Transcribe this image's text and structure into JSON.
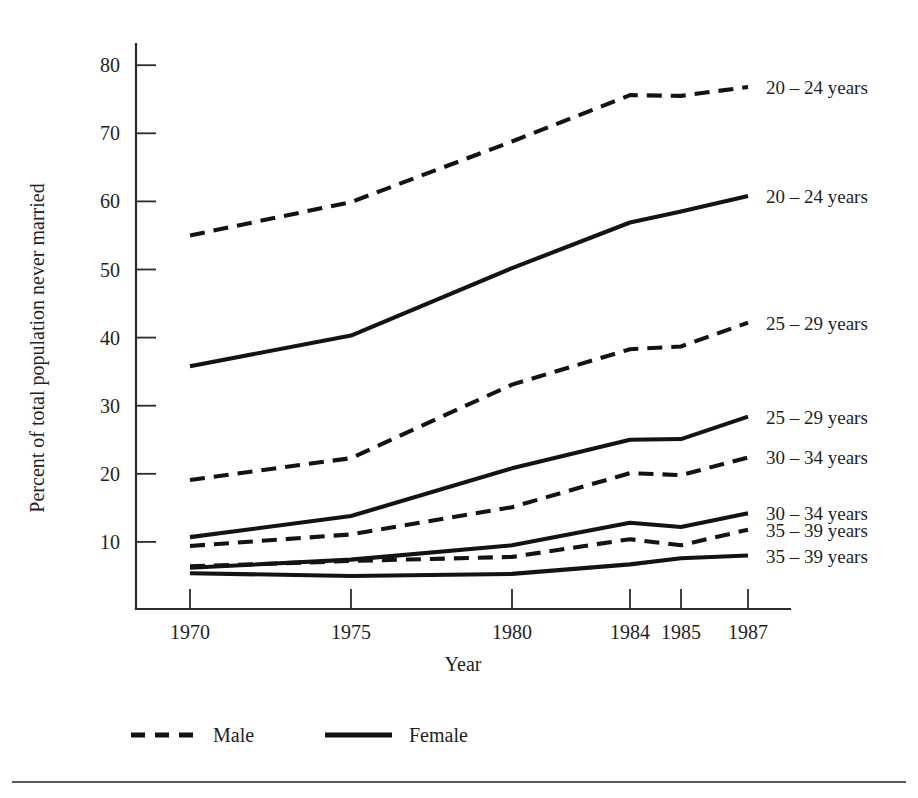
{
  "chart_data": {
    "type": "line",
    "title": "",
    "xlabel": "Year",
    "ylabel": "Percent of total population never married",
    "x": [
      1970,
      1975,
      1980,
      1984,
      1985,
      1987
    ],
    "xtick_labels": [
      "1970",
      "1975",
      "1980",
      "1984",
      "1985",
      "1987"
    ],
    "ytick_labels": [
      "10",
      "20",
      "30",
      "40",
      "50",
      "60",
      "70",
      "80"
    ],
    "yticks": [
      10,
      20,
      30,
      40,
      50,
      60,
      70,
      80
    ],
    "ylim": [
      0,
      84
    ],
    "xlim_positions": [
      190,
      351,
      512,
      630,
      681,
      748
    ],
    "grid": false,
    "legend_position": "below-axes-left",
    "series": [
      {
        "name": "Male 20 - 24 years",
        "sex": "Male",
        "age_group": "20 – 24 years",
        "style": "dashed",
        "end_label": "20 – 24 years",
        "values": [
          55.0,
          59.9,
          68.8,
          75.6,
          75.5,
          76.8
        ]
      },
      {
        "name": "Female 20 - 24 years",
        "sex": "Female",
        "age_group": "20 – 24 years",
        "style": "solid",
        "end_label": "20 – 24 years",
        "values": [
          35.8,
          40.3,
          50.2,
          56.9,
          58.5,
          60.8
        ]
      },
      {
        "name": "Male 25 - 29 years",
        "sex": "Male",
        "age_group": "25 – 29 years",
        "style": "dashed",
        "end_label": "25 – 29 years",
        "values": [
          19.1,
          22.3,
          33.1,
          38.3,
          38.7,
          42.2
        ]
      },
      {
        "name": "Female 25 - 29 years",
        "sex": "Female",
        "age_group": "25 – 29 years",
        "style": "solid",
        "end_label": "25 – 29 years",
        "values": [
          10.7,
          13.8,
          20.8,
          25.0,
          25.1,
          28.4
        ]
      },
      {
        "name": "Male 30 - 34 years",
        "sex": "Male",
        "age_group": "30 – 34 years",
        "style": "dashed",
        "end_label": "30 – 34 years",
        "values": [
          9.4,
          11.1,
          15.1,
          20.1,
          19.8,
          22.4
        ]
      },
      {
        "name": "Female 30 - 34 years",
        "sex": "Female",
        "age_group": "30 – 34 years",
        "style": "solid",
        "end_label": "30 – 34 years",
        "values": [
          6.2,
          7.4,
          9.5,
          12.8,
          12.2,
          14.2
        ]
      },
      {
        "name": "Male 35 - 39 years",
        "sex": "Male",
        "age_group": "35 – 39 years",
        "style": "dashed",
        "end_label": "35 – 39 years",
        "values": [
          6.4,
          7.2,
          7.8,
          10.4,
          9.5,
          11.8
        ]
      },
      {
        "name": "Female 35 - 39 years",
        "sex": "Female",
        "age_group": "35 – 39 years",
        "style": "solid",
        "end_label": "35 – 39 years",
        "values": [
          5.4,
          5.0,
          5.3,
          6.7,
          7.6,
          8.0
        ]
      }
    ],
    "end_labels": [
      {
        "text": "20 – 24 years",
        "y_value": 76.8,
        "style": "dashed"
      },
      {
        "text": "20 – 24 years",
        "y_value": 60.8,
        "style": "solid"
      },
      {
        "text": "25 – 29 years",
        "y_value": 42.2,
        "style": "dashed"
      },
      {
        "text": "25 – 29 years",
        "y_value": 28.4,
        "style": "solid"
      },
      {
        "text": "30 – 34 years",
        "y_value": 22.4,
        "style": "dashed"
      },
      {
        "text": "30 – 34 years",
        "y_value": 14.2,
        "style": "solid"
      },
      {
        "text": "35 – 39 years",
        "y_value": 11.8,
        "style": "dashed"
      },
      {
        "text": "35 – 39 years",
        "y_value": 8.0,
        "style": "solid"
      }
    ],
    "legend": [
      {
        "label": "Male",
        "style": "dashed"
      },
      {
        "label": "Female",
        "style": "solid"
      }
    ]
  },
  "axes": {
    "x_title": "Year",
    "y_title": "Percent of total population never married"
  },
  "legend": {
    "male_label": "Male",
    "female_label": "Female"
  }
}
